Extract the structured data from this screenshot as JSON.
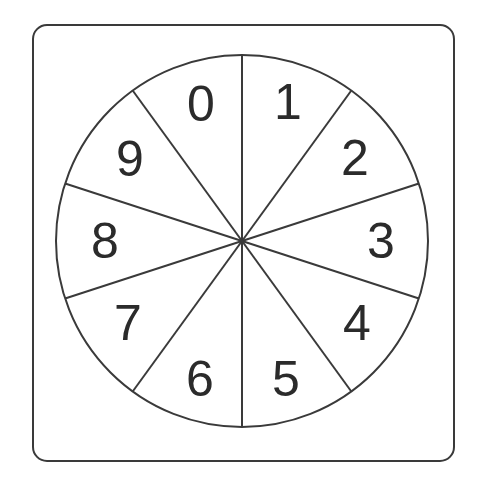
{
  "canvas": {
    "width": 478,
    "height": 482,
    "background": "#ffffff"
  },
  "frame": {
    "name": "rounded-card-border",
    "x": 33,
    "y": 25,
    "width": 421,
    "height": 436,
    "corner_radius": 14,
    "stroke_color": "#3a3a3a",
    "stroke_width": 2,
    "fill": "#ffffff"
  },
  "wheel": {
    "name": "spinner-wheel",
    "center_x": 242,
    "center_y": 241,
    "radius": 186,
    "stroke_color": "#3a3a3a",
    "stroke_width": 2,
    "fill": "#ffffff",
    "sector_count": 10,
    "sector_angle_degrees": 36,
    "start_angle_degrees": 0,
    "label_radius": 124,
    "label_font_size": 50,
    "labels": [
      "0",
      "1",
      "2",
      "3",
      "4",
      "5",
      "6",
      "7",
      "8",
      "9"
    ],
    "sectors": [
      {
        "label": "0",
        "index": 0,
        "start_deg": -36,
        "end_deg": 0,
        "label_x": 201,
        "label_y": 104
      },
      {
        "label": "1",
        "index": 1,
        "start_deg": 0,
        "end_deg": 36,
        "label_x": 288,
        "label_y": 102
      },
      {
        "label": "2",
        "index": 2,
        "start_deg": 36,
        "end_deg": 72,
        "label_x": 355,
        "label_y": 158
      },
      {
        "label": "3",
        "index": 3,
        "start_deg": 72,
        "end_deg": 108,
        "label_x": 381,
        "label_y": 241
      },
      {
        "label": "4",
        "index": 4,
        "start_deg": 108,
        "end_deg": 144,
        "label_x": 357,
        "label_y": 323
      },
      {
        "label": "5",
        "index": 5,
        "start_deg": 144,
        "end_deg": 180,
        "label_x": 286,
        "label_y": 379
      },
      {
        "label": "6",
        "index": 6,
        "start_deg": 180,
        "end_deg": 216,
        "label_x": 200,
        "label_y": 379
      },
      {
        "label": "7",
        "index": 7,
        "start_deg": 216,
        "end_deg": 252,
        "label_x": 128,
        "label_y": 323
      },
      {
        "label": "8",
        "index": 8,
        "start_deg": 252,
        "end_deg": 288,
        "label_x": 105,
        "label_y": 241
      },
      {
        "label": "9",
        "index": 9,
        "start_deg": 288,
        "end_deg": 324,
        "label_x": 130,
        "label_y": 159
      }
    ],
    "spokes": [
      {
        "angle_deg": 0,
        "name": "spoke-0"
      },
      {
        "angle_deg": 36,
        "name": "spoke-36"
      },
      {
        "angle_deg": 72,
        "name": "spoke-72"
      },
      {
        "angle_deg": 108,
        "name": "spoke-108"
      },
      {
        "angle_deg": 144,
        "name": "spoke-144"
      }
    ]
  }
}
